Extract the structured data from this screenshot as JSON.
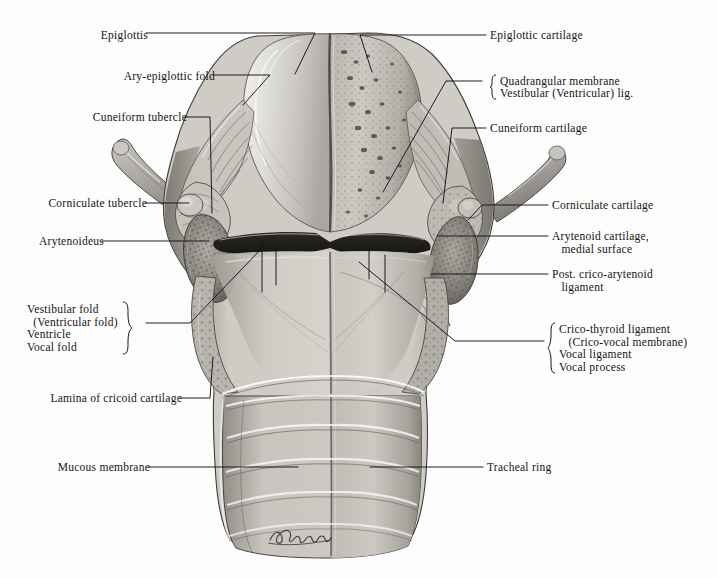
{
  "figure": {
    "background_color": "#fdfdfd",
    "ink_color": "#141414",
    "signature": "Stubbs"
  },
  "labels_left": [
    {
      "id": "epiglottis",
      "text": "Epiglottis",
      "x": 78,
      "y": 29,
      "dash": true
    },
    {
      "id": "ary-epiglottic-fold",
      "text": "Ary-epiglottic fold",
      "x": 108,
      "y": 71,
      "dash": true
    },
    {
      "id": "cuneiform-tubercle",
      "text": "Cuneiform tubercle",
      "x": 70,
      "y": 112,
      "dash": true
    },
    {
      "id": "corniculate-tubercle",
      "text": "Corniculate tubercle",
      "x": 24,
      "y": 199,
      "dash": true
    },
    {
      "id": "arytenoideus",
      "text": "Arytenoideus",
      "x": 24,
      "y": 236,
      "dash": true
    },
    {
      "id": "lamina-of-cricoid",
      "text": "Lamina of cricoid cartilage",
      "x": 24,
      "y": 394,
      "dash": true
    },
    {
      "id": "mucous-membrane",
      "text": "Mucous membrane",
      "x": 30,
      "y": 463,
      "dash": true
    }
  ],
  "labels_right": [
    {
      "id": "epiglottic-cartilage",
      "text": "Epiglottic cartilage",
      "x": 490,
      "y": 31,
      "dash": true
    },
    {
      "id": "cuneiform-cartilage",
      "text": "Cuneiform cartilage",
      "x": 490,
      "y": 124,
      "dash": true
    },
    {
      "id": "corniculate-cartilage",
      "text": "Corniculate cartilage",
      "x": 552,
      "y": 201,
      "dash": true
    },
    {
      "id": "tracheal-ring",
      "text": "Tracheal ring",
      "x": 487,
      "y": 463,
      "dash": true
    }
  ],
  "label_groups_right": [
    {
      "id": "quadrangular-membrane-group",
      "x": 490,
      "y": 72,
      "lines": [
        "Quadrangular membrane",
        "Vestibular (Ventricular) lig."
      ]
    },
    {
      "id": "arytenoid-cartilage-group",
      "x": 552,
      "y": 230,
      "lines": [
        "Arytenoid cartilage,",
        "   medial surface"
      ],
      "no_brace": true
    },
    {
      "id": "post-crico-arytenoid-group",
      "x": 552,
      "y": 268,
      "lines": [
        "Post. crico-arytenoid",
        "   ligament"
      ],
      "no_brace": true
    },
    {
      "id": "crico-thyroid-group",
      "x": 551,
      "y": 321,
      "lines": [
        "Crico-thyroid ligament",
        "   (Crico-vocal membrane)",
        "Vocal ligament",
        "Vocal process"
      ]
    }
  ],
  "label_groups_left": [
    {
      "id": "vestibular-fold-group",
      "x": 27,
      "y": 301,
      "lines": [
        "Vestibular fold",
        "  (Ventricular fold)",
        "Ventricle",
        "Vocal fold"
      ]
    }
  ],
  "anatomy_parts": [
    "epiglottis",
    "epiglottic cartilage",
    "ary-epiglottic fold",
    "cuneiform tubercle",
    "cuneiform cartilage",
    "corniculate tubercle",
    "corniculate cartilage",
    "arytenoideus muscle",
    "arytenoid cartilage",
    "superior cornu of thyroid cartilage",
    "vestibular fold",
    "ventricle",
    "vocal fold",
    "vocal ligament",
    "vocal process",
    "crico-thyroid ligament",
    "post. crico-arytenoid ligament",
    "lamina of cricoid cartilage",
    "mucous membrane",
    "tracheal ring",
    "trachea"
  ]
}
